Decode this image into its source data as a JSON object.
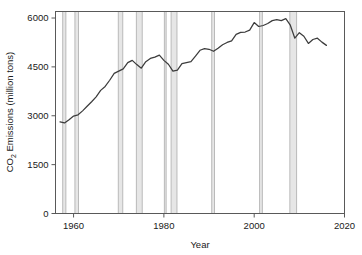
{
  "chart_data": {
    "type": "line",
    "title": "",
    "xlabel": "Year",
    "ylabel": "CO2 Emissions (million tons)",
    "ylabel_parts": {
      "prefix": "CO",
      "subscript": "2",
      "suffix": " Emissions (million tons)"
    },
    "xlim": [
      1956,
      2020
    ],
    "ylim": [
      0,
      6200
    ],
    "grid": false,
    "legend": null,
    "line_color": "#3c3c3c",
    "recession_band_color": "#b4b4b4",
    "axis_color": "#595959",
    "xticks": [
      1960,
      1980,
      2000,
      2020
    ],
    "xtick_labels": [
      "1960",
      "1980",
      "2000",
      "2020"
    ],
    "yticks": [
      0,
      1500,
      3000,
      4500,
      6000
    ],
    "ytick_labels": [
      "0",
      "1500",
      "3000",
      "4500",
      "6000"
    ],
    "x": [
      1957,
      1958,
      1959,
      1960,
      1961,
      1962,
      1963,
      1964,
      1965,
      1966,
      1967,
      1968,
      1969,
      1970,
      1971,
      1972,
      1973,
      1974,
      1975,
      1976,
      1977,
      1978,
      1979,
      1980,
      1981,
      1982,
      1983,
      1984,
      1985,
      1986,
      1987,
      1988,
      1989,
      1990,
      1991,
      1992,
      1993,
      1994,
      1995,
      1996,
      1997,
      1998,
      1999,
      2000,
      2001,
      2002,
      2003,
      2004,
      2005,
      2006,
      2007,
      2008,
      2009,
      2010,
      2011,
      2012,
      2013,
      2014,
      2015,
      2016
    ],
    "values": [
      2810,
      2780,
      2880,
      2990,
      3030,
      3150,
      3290,
      3430,
      3580,
      3780,
      3900,
      4090,
      4300,
      4370,
      4440,
      4630,
      4700,
      4570,
      4460,
      4660,
      4760,
      4800,
      4860,
      4700,
      4580,
      4370,
      4400,
      4600,
      4630,
      4660,
      4830,
      5010,
      5060,
      5040,
      4980,
      5070,
      5180,
      5250,
      5300,
      5500,
      5560,
      5570,
      5630,
      5860,
      5740,
      5770,
      5830,
      5920,
      5950,
      5920,
      5980,
      5780,
      5380,
      5550,
      5440,
      5220,
      5340,
      5380,
      5260,
      5160
    ],
    "recessions": [
      {
        "label": "1957-1958",
        "start": 1957.6,
        "end": 1958.3
      },
      {
        "label": "1960-1961",
        "start": 1960.3,
        "end": 1961.1
      },
      {
        "label": "1969-1970",
        "start": 1969.9,
        "end": 1970.9
      },
      {
        "label": "1973-1975",
        "start": 1973.9,
        "end": 1975.2
      },
      {
        "label": "1980",
        "start": 1980.1,
        "end": 1980.5
      },
      {
        "label": "1981-1982",
        "start": 1981.6,
        "end": 1982.9
      },
      {
        "label": "1990-1991",
        "start": 1990.6,
        "end": 1991.2
      },
      {
        "label": "2001",
        "start": 2001.2,
        "end": 2001.8
      },
      {
        "label": "2007-2009",
        "start": 2007.9,
        "end": 2009.4
      }
    ]
  }
}
